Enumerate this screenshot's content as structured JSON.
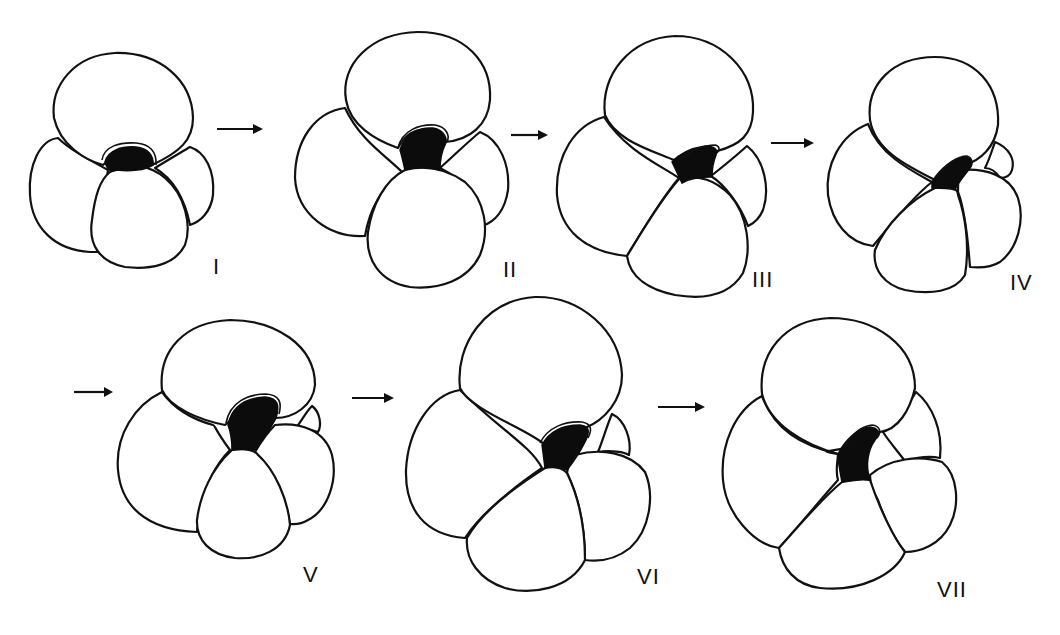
{
  "figure": {
    "colors": {
      "line": "#111111",
      "aperture_fill": "#0c0c0c",
      "background": "#ffffff"
    },
    "stages": [
      {
        "id": "I",
        "label": "I"
      },
      {
        "id": "II",
        "label": "II"
      },
      {
        "id": "III",
        "label": "III"
      },
      {
        "id": "IV",
        "label": "IV"
      },
      {
        "id": "V",
        "label": "V"
      },
      {
        "id": "VI",
        "label": "VI"
      },
      {
        "id": "VII",
        "label": "VII"
      }
    ],
    "arrows": [
      {
        "from": "I",
        "to": "II",
        "glyph": "right-arrow"
      },
      {
        "from": "II",
        "to": "III",
        "glyph": "right-arrow"
      },
      {
        "from": "III",
        "to": "IV",
        "glyph": "right-arrow"
      },
      {
        "from": "IV",
        "to": "V",
        "glyph": "right-arrow"
      },
      {
        "from": "V",
        "to": "VI",
        "glyph": "right-arrow"
      },
      {
        "from": "VI",
        "to": "VII",
        "glyph": "right-arrow"
      }
    ]
  }
}
